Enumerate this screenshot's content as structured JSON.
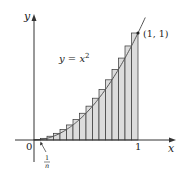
{
  "diagram": {
    "type": "riemann-sum-upper-rectangles",
    "function_label": "y = x²",
    "function_label_parts": {
      "lhs": "y",
      "eq": " = ",
      "base": "x",
      "exp": "2"
    },
    "point_label": "(1, 1)",
    "axis_labels": {
      "x": "x",
      "y": "y"
    },
    "tick_labels": {
      "origin": "0",
      "one": "1"
    },
    "subinterval_label": {
      "numerator": "1",
      "denominator": "n"
    },
    "n_rectangles": 16,
    "domain": [
      0,
      1
    ],
    "colors": {
      "axis": "#333333",
      "curve": "#555555",
      "rect_fill": "#dcdcdc",
      "rect_stroke": "#333333",
      "text": "#222222"
    }
  },
  "chart_data": {
    "type": "area",
    "title": "",
    "xlabel": "x",
    "ylabel": "y",
    "curve": "y = x^2",
    "xlim": [
      0,
      1
    ],
    "ylim": [
      0,
      1
    ],
    "rectangles": {
      "n": 16,
      "rule": "right-endpoint",
      "width": 0.0625,
      "heights": [
        0.0039,
        0.0156,
        0.0352,
        0.0625,
        0.0977,
        0.1406,
        0.1914,
        0.25,
        0.3164,
        0.3906,
        0.4727,
        0.5625,
        0.6602,
        0.7656,
        0.8789,
        1.0
      ]
    },
    "annotations": [
      "y = x²",
      "(1, 1)",
      "1/n"
    ]
  }
}
